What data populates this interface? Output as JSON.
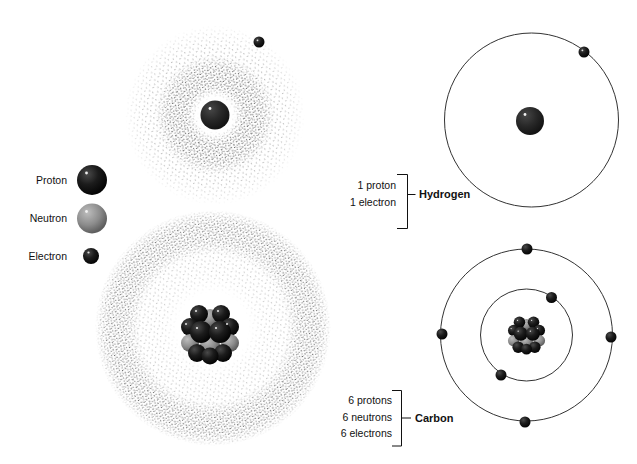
{
  "legend": {
    "items": [
      {
        "label": "Proton",
        "particle": "proton"
      },
      {
        "label": "Neutron",
        "particle": "neutron"
      },
      {
        "label": "Electron",
        "particle": "electron"
      }
    ]
  },
  "atoms": [
    {
      "name": "Hydrogen",
      "composition": [
        "1 proton",
        "1 electron"
      ],
      "protons": 1,
      "neutrons": 0,
      "electrons": 1,
      "shells": [
        1
      ],
      "models": [
        "electron-cloud",
        "orbital-shell"
      ]
    },
    {
      "name": "Carbon",
      "composition": [
        "6 protons",
        "6 neutrons",
        "6 electrons"
      ],
      "protons": 6,
      "neutrons": 6,
      "electrons": 6,
      "shells": [
        2,
        4
      ],
      "models": [
        "electron-cloud",
        "orbital-shell"
      ]
    }
  ],
  "colors": {
    "proton": "#141414",
    "neutron": "#8c8c8c",
    "electron": "#0a0a0a",
    "orbit": "#333333",
    "stipple": "#1a1a1a",
    "text": "#111111",
    "background": "#ffffff"
  }
}
